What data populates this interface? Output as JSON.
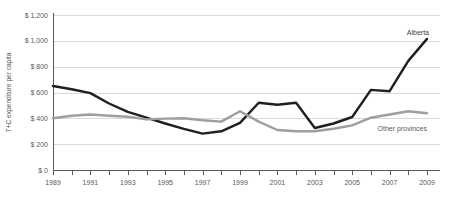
{
  "chart": {
    "ylabel": "T+C expenditure per capita"
  },
  "chart_data": {
    "type": "line",
    "title": "",
    "xlabel": "",
    "ylabel": "T+C expenditure per capita",
    "x": [
      1989,
      1990,
      1991,
      1992,
      1993,
      1994,
      1995,
      1996,
      1997,
      1998,
      1999,
      2000,
      2001,
      2002,
      2003,
      2004,
      2005,
      2006,
      2007,
      2008,
      2009
    ],
    "x_tick_labels": [
      "1989",
      "1991",
      "1993",
      "1995",
      "1997",
      "1999",
      "2001",
      "2003",
      "2005",
      "2007",
      "2009"
    ],
    "ylim": [
      0,
      1200
    ],
    "y_ticks": {
      "values": [
        0,
        200,
        400,
        600,
        800,
        1000,
        1200
      ],
      "labels": [
        "$ 0",
        "$ 200",
        "$ 400",
        "$ 600",
        "$ 800",
        "$ 1,000",
        "$ 1,200"
      ]
    },
    "grid": "horizontal",
    "legend_position": "end-of-line-annotations",
    "series": [
      {
        "name": "Alberta",
        "color": "#1f1f1f",
        "label_color": "#404040",
        "values": [
          650,
          625,
          595,
          515,
          450,
          405,
          360,
          318,
          282,
          300,
          365,
          520,
          505,
          520,
          325,
          360,
          410,
          620,
          610,
          845,
          1015
        ]
      },
      {
        "name": "Other provinces",
        "color": "#9e9e9e",
        "label_color": "#595959",
        "values": [
          400,
          420,
          430,
          420,
          412,
          392,
          398,
          400,
          385,
          375,
          455,
          375,
          310,
          300,
          300,
          320,
          345,
          405,
          430,
          455,
          440
        ]
      }
    ],
    "colors": {
      "axis": "#595959",
      "grid": "#d9d9d9",
      "tick_label": "#595959"
    }
  }
}
